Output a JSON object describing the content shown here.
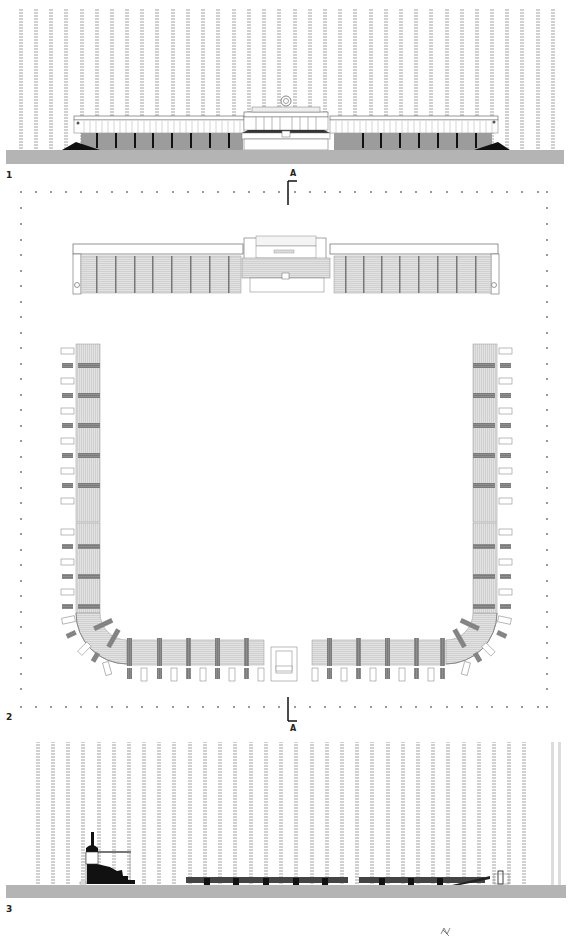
{
  "drawing": {
    "title": "Stadium elevation, plan and section",
    "colors": {
      "background": "#ffffff",
      "ground": "#b4b4b4",
      "tree": "#cfcfcf",
      "stand_fill": "#dedede",
      "stand_stripe": "#9a9a9a",
      "dark": "#111111",
      "line": "#666666"
    }
  },
  "panels": [
    {
      "id": "1",
      "label": "1",
      "type": "elevation"
    },
    {
      "id": "2",
      "label": "2",
      "type": "plan"
    },
    {
      "id": "3",
      "label": "3",
      "type": "section"
    }
  ],
  "section_markers": [
    {
      "position": "top",
      "label": "A"
    },
    {
      "position": "bottom",
      "label": "A"
    }
  ],
  "north_arrow": {
    "label": "N"
  }
}
